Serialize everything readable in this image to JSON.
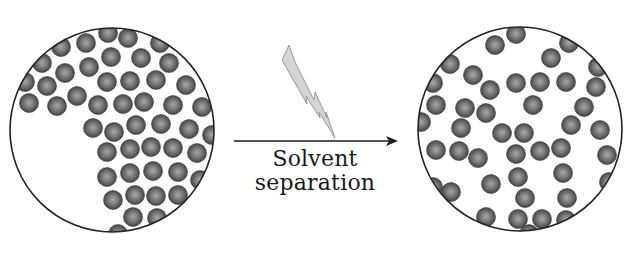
{
  "diagram": {
    "process_label_line1": "Solvent",
    "process_label_line2": "separation",
    "colors": {
      "outline": "#222222",
      "sphere_light": "#a8a8a8",
      "sphere_mid": "#707070",
      "sphere_dark": "#3a3a3a",
      "bolt_fill": "#d4d4d4",
      "bolt_stroke": "#9a9a9a",
      "arrow": "#1a1a1a"
    },
    "sphere_radius": 9.5,
    "left_circle": {
      "name": "aggregated-state",
      "cx": 112,
      "cy": 130,
      "r": 102,
      "spheres": [
        [
          108,
          33
        ],
        [
          128,
          38
        ],
        [
          160,
          43
        ],
        [
          86,
          43
        ],
        [
          61,
          47
        ],
        [
          111,
          57
        ],
        [
          141,
          58
        ],
        [
          169,
          63
        ],
        [
          42,
          63
        ],
        [
          89,
          67
        ],
        [
          65,
          73
        ],
        [
          107,
          82
        ],
        [
          130,
          81
        ],
        [
          156,
          80
        ],
        [
          186,
          85
        ],
        [
          47,
          86
        ],
        [
          25,
          82
        ],
        [
          77,
          96
        ],
        [
          98,
          105
        ],
        [
          123,
          104
        ],
        [
          144,
          102
        ],
        [
          173,
          105
        ],
        [
          202,
          107
        ],
        [
          29,
          103
        ],
        [
          57,
          106
        ],
        [
          93,
          128
        ],
        [
          114,
          132
        ],
        [
          136,
          125
        ],
        [
          161,
          124
        ],
        [
          189,
          129
        ],
        [
          212,
          135
        ],
        [
          107,
          152
        ],
        [
          130,
          149
        ],
        [
          151,
          147
        ],
        [
          173,
          148
        ],
        [
          197,
          153
        ],
        [
          107,
          177
        ],
        [
          130,
          173
        ],
        [
          153,
          171
        ],
        [
          178,
          172
        ],
        [
          200,
          180
        ],
        [
          113,
          200
        ],
        [
          135,
          195
        ],
        [
          156,
          196
        ],
        [
          178,
          195
        ],
        [
          133,
          217
        ],
        [
          157,
          218
        ],
        [
          118,
          234
        ]
      ]
    },
    "right_circle": {
      "name": "dispersed-state",
      "cx": 520,
      "cy": 129,
      "r": 102,
      "spheres": [
        [
          516,
          34
        ],
        [
          495,
          45
        ],
        [
          569,
          43
        ],
        [
          551,
          58
        ],
        [
          450,
          64
        ],
        [
          598,
          67
        ],
        [
          473,
          75
        ],
        [
          516,
          83
        ],
        [
          540,
          82
        ],
        [
          566,
          82
        ],
        [
          596,
          87
        ],
        [
          490,
          90
        ],
        [
          433,
          83
        ],
        [
          436,
          105
        ],
        [
          465,
          108
        ],
        [
          486,
          113
        ],
        [
          533,
          105
        ],
        [
          584,
          107
        ],
        [
          421,
          122
        ],
        [
          461,
          128
        ],
        [
          502,
          133
        ],
        [
          524,
          133
        ],
        [
          571,
          125
        ],
        [
          600,
          130
        ],
        [
          436,
          150
        ],
        [
          459,
          151
        ],
        [
          478,
          158
        ],
        [
          516,
          154
        ],
        [
          540,
          151
        ],
        [
          561,
          148
        ],
        [
          607,
          155
        ],
        [
          518,
          177
        ],
        [
          563,
          173
        ],
        [
          491,
          184
        ],
        [
          451,
          192
        ],
        [
          609,
          182
        ],
        [
          433,
          187
        ],
        [
          525,
          198
        ],
        [
          567,
          198
        ],
        [
          486,
          217
        ],
        [
          518,
          219
        ],
        [
          542,
          219
        ],
        [
          566,
          220
        ],
        [
          529,
          234
        ]
      ]
    },
    "arrow": {
      "x1": 234,
      "y1": 141,
      "x2": 398,
      "y2": 141
    },
    "bolt": {
      "points": "289,45 282,60 307,104 306,96 320,118 319,112 335,138 326,112 327,118 315,92 314,100 295,62"
    }
  }
}
